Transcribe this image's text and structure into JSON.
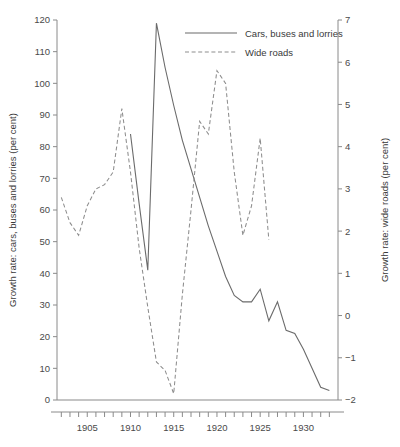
{
  "chart_data": {
    "type": "line",
    "title": "",
    "xlabel": "",
    "ylabel": "Growth rate: cars, buses and lorries (per cent)",
    "y2label": "Growth rate: wide roads (per cent)",
    "xlim": [
      1901.5,
      1934
    ],
    "ylim": [
      0,
      120
    ],
    "y2lim": [
      -2,
      7
    ],
    "grid": false,
    "legend_position": "top-center",
    "x_ticks_major": [
      1905,
      1910,
      1915,
      1920,
      1925,
      1930
    ],
    "x_tick_labels": [
      "1905",
      "1910",
      "1915",
      "1920",
      "1925",
      "1930"
    ],
    "x_ticks_minor_step": 1,
    "y_ticks": [
      0,
      10,
      20,
      30,
      40,
      50,
      60,
      70,
      80,
      90,
      100,
      110,
      120
    ],
    "y_tick_labels": [
      "0",
      "10",
      "20",
      "30",
      "40",
      "50",
      "60",
      "70",
      "80",
      "90",
      "100",
      "110",
      "120"
    ],
    "y2_ticks": [
      -2,
      -1,
      0,
      1,
      2,
      3,
      4,
      5,
      6,
      7
    ],
    "y2_tick_labels": [
      "−2",
      "−1",
      "0",
      "1",
      "2",
      "3",
      "4",
      "5",
      "6",
      "7"
    ],
    "series": [
      {
        "name": "Cars, buses and lorries",
        "axis": "left",
        "style": "solid",
        "color": "#6b6b6b",
        "x": [
          1910,
          1911,
          1912,
          1913,
          1914,
          1915,
          1916,
          1917,
          1918,
          1919,
          1920,
          1921,
          1922,
          1923,
          1924,
          1925,
          1926,
          1927,
          1928,
          1929,
          1930,
          1931,
          1932,
          1933
        ],
        "values": [
          84,
          62,
          41,
          119,
          105,
          93,
          82,
          73,
          64,
          55,
          47,
          39,
          33,
          31,
          31,
          35,
          25,
          31,
          22,
          21,
          16,
          10,
          4,
          3
        ]
      },
      {
        "name": "Wide roads",
        "axis": "right",
        "style": "dashed",
        "color": "#8d8d8d",
        "x": [
          1902,
          1903,
          1904,
          1905,
          1906,
          1907,
          1908,
          1909,
          1910,
          1911,
          1912,
          1913,
          1914,
          1915,
          1916,
          1917,
          1918,
          1919,
          1920,
          1921,
          1922,
          1923,
          1924,
          1925,
          1926
        ],
        "values": [
          2.8,
          2.2,
          1.9,
          2.6,
          3.0,
          3.1,
          3.4,
          4.9,
          3.4,
          1.6,
          0.2,
          -1.1,
          -1.3,
          -1.85,
          0.5,
          2.5,
          4.6,
          4.3,
          5.8,
          5.5,
          3.4,
          1.9,
          2.6,
          4.2,
          1.8
        ]
      }
    ]
  },
  "legend": {
    "items": [
      {
        "label": "Cars, buses and lorries",
        "style": "solid"
      },
      {
        "label": "Wide roads",
        "style": "dashed"
      }
    ]
  },
  "axes": {
    "left_title": "Growth rate: cars, buses and lorries (per cent)",
    "right_title": "Growth rate: wide roads (per cent)"
  }
}
